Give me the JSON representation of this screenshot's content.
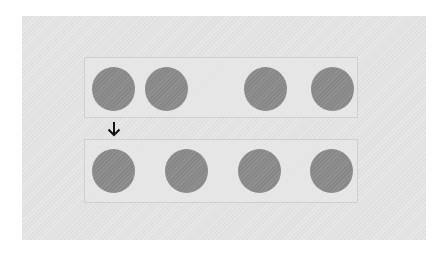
{
  "diagram": {
    "type": "flex-distribution-illustration",
    "colors": {
      "background": "#e4e4e4",
      "container_border": "#cfcfcf",
      "item": "#8c8c8c",
      "arrow": "#111111"
    },
    "top_row": {
      "items": [
        {
          "x": 92,
          "y": 67
        },
        {
          "x": 145,
          "y": 67
        },
        {
          "x": 244,
          "y": 67
        },
        {
          "x": 311,
          "y": 67
        }
      ]
    },
    "bottom_row": {
      "items": [
        {
          "x": 92,
          "y": 149
        },
        {
          "x": 165,
          "y": 149
        },
        {
          "x": 238,
          "y": 149
        },
        {
          "x": 310,
          "y": 149
        }
      ]
    },
    "arrow_icon": "arrow-down-icon"
  }
}
